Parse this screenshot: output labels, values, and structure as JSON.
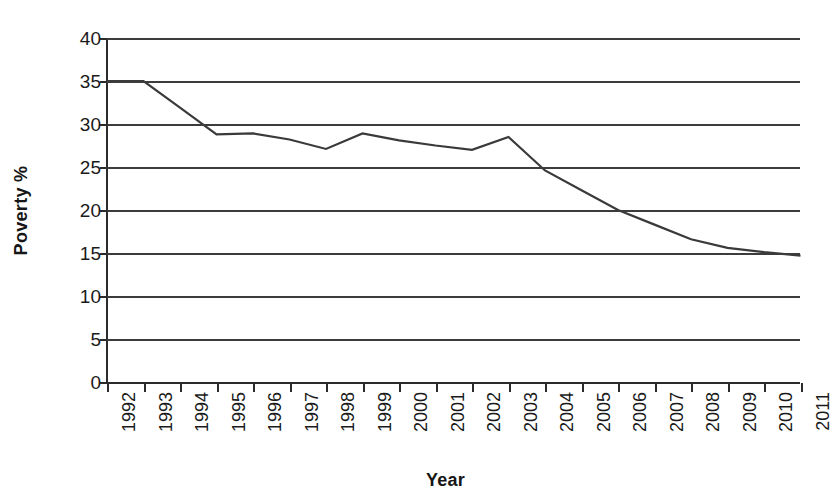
{
  "chart_data": {
    "type": "line",
    "title": "",
    "xlabel": "Year",
    "ylabel": "Poverty %",
    "categories": [
      "1992",
      "1993",
      "1994",
      "1995",
      "1996",
      "1997",
      "1998",
      "1999",
      "2000",
      "2001",
      "2002",
      "2003",
      "2004",
      "2005",
      "2006",
      "2007",
      "2008",
      "2009",
      "2010",
      "2011"
    ],
    "values": [
      35.0,
      35.0,
      31.9,
      28.8,
      28.9,
      28.2,
      27.1,
      28.9,
      28.1,
      27.5,
      27.0,
      28.5,
      24.6,
      22.3,
      20.0,
      18.3,
      16.6,
      15.6,
      15.1,
      14.7
    ],
    "series": [
      {
        "name": "Poverty %",
        "values": [
          35.0,
          35.0,
          31.9,
          28.8,
          28.9,
          28.2,
          27.1,
          28.9,
          28.1,
          27.5,
          27.0,
          28.5,
          24.6,
          22.3,
          20.0,
          18.3,
          16.6,
          15.6,
          15.1,
          14.7
        ]
      }
    ],
    "ylim": [
      0,
      40
    ],
    "y_ticks": [
      0,
      5,
      10,
      15,
      20,
      25,
      30,
      35,
      40
    ],
    "y_tick_labels": [
      "0",
      "5",
      "10",
      "15",
      "20",
      "25",
      "30",
      "35",
      "40"
    ],
    "grid": true,
    "grid_orientation": "horizontal",
    "legend": false,
    "legend_position": "none",
    "line_color": "#3a3a3a",
    "marker": "none"
  },
  "axes": {
    "y_title": "Poverty %",
    "x_title": "Year"
  },
  "colors": {
    "line": "#3a3a3a",
    "grid": "#3c3c3c",
    "axis": "#2b2b2b",
    "text": "#1a1a1a",
    "background": "#ffffff"
  }
}
